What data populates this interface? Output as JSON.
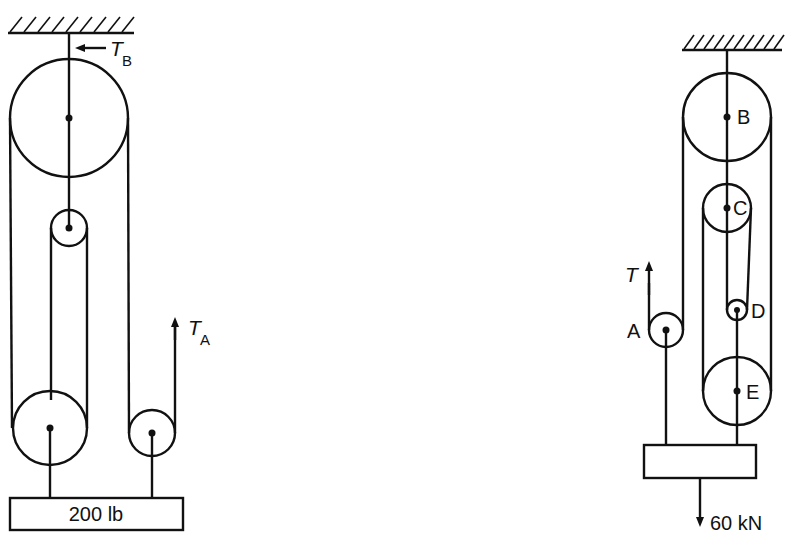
{
  "figure_left": {
    "load_label": "200 lb",
    "tension_b": {
      "symbol": "T",
      "subscript": "B"
    },
    "tension_a": {
      "symbol": "T",
      "subscript": "A"
    }
  },
  "figure_right": {
    "pulley_labels": [
      "A",
      "B",
      "C",
      "D",
      "E"
    ],
    "tension": {
      "symbol": "T"
    },
    "load_label": "60 kN"
  }
}
